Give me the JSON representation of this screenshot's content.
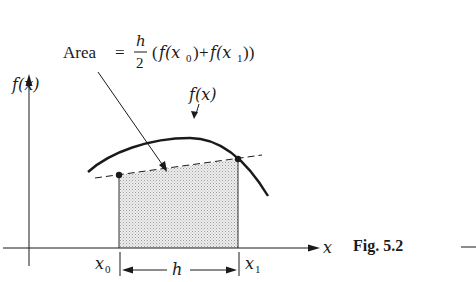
{
  "figure": {
    "caption": "Fig. 5.2",
    "area_label": {
      "word": "Area",
      "equals": "=",
      "frac_num": "h",
      "frac_den": "2",
      "open_paren": "(",
      "term1_f": "f(x",
      "term1_sub": "0",
      "term1_close": ")",
      "plus": "+",
      "term2_f": "f(x",
      "term2_sub": "1",
      "term2_close": "))"
    },
    "y_axis_label": "f(x)",
    "curve_label": "f(x)",
    "x_axis_label": "x",
    "x0_label": "x",
    "x0_sub": "0",
    "x1_label": "x",
    "x1_sub": "1",
    "width_label": "h",
    "trailing_dash": "—"
  },
  "colors": {
    "ink": "#1a1a1a",
    "shade": "#d9d9d9"
  }
}
